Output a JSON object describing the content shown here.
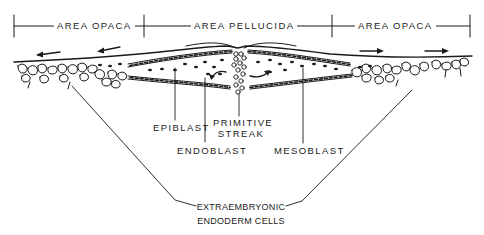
{
  "regions": {
    "left": "AREA OPACA",
    "center": "AREA PELLUCIDA",
    "right": "AREA OPACA"
  },
  "labels": {
    "epiblast": "EPIBLAST",
    "primitive_streak_line1": "PRIMITIVE",
    "primitive_streak_line2": "STREAK",
    "endoblast": "ENDOBLAST",
    "mesoblast": "MESOBLAST",
    "extraembryonic_line1": "EXTRAEMBRYONIC",
    "extraembryonic_line2": "ENDODERM CELLS"
  },
  "arrows": {
    "left_direction": "left",
    "right_direction": "right",
    "count_each_side": 2
  },
  "colors": {
    "ink": "#1a1a1a",
    "background": "#ffffff"
  }
}
